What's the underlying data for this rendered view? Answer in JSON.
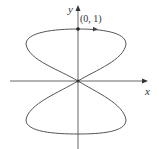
{
  "figure": {
    "axes": {
      "x_label": "x",
      "y_label": "y"
    },
    "point": {
      "label": "(0, 1)",
      "x": 0,
      "y": 1
    },
    "curve": {
      "description": "Figure-eight curve symmetric about both axes, passing through origin, with top point (0,1) and direction arrow pointing right at top",
      "stroke": "#555555"
    },
    "colors": {
      "axis": "#555555",
      "curve": "#555555",
      "background": "#ffffff"
    }
  }
}
